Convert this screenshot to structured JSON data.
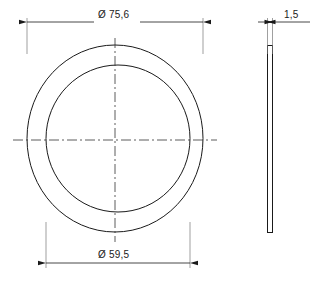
{
  "drawing": {
    "type": "engineering-drawing",
    "subject": "flat ring / shim washer",
    "units": "mm",
    "line_color": "#1a1a1a",
    "centerline_color": "#333333",
    "background_color": "#ffffff",
    "views": {
      "front": {
        "name": "front-view",
        "shape": "annulus",
        "outer_diameter_label": "Ø 75,6",
        "outer_diameter_value": 75.6,
        "inner_diameter_label": "Ø 59,5",
        "inner_diameter_value": 59.5
      },
      "side": {
        "name": "side-view",
        "shape": "thin-rectangle",
        "thickness_label": "1,5",
        "thickness_value": 1.5
      }
    },
    "dimensions": [
      {
        "id": "outer-diameter",
        "label": "Ø 75,6",
        "value": 75.6,
        "symbol": "Ø",
        "placement": "top",
        "arrows": "outward"
      },
      {
        "id": "inner-diameter",
        "label": "Ø 59,5",
        "value": 59.5,
        "symbol": "Ø",
        "placement": "bottom",
        "arrows": "outward"
      },
      {
        "id": "thickness",
        "label": "1,5",
        "value": 1.5,
        "symbol": "",
        "placement": "top-right",
        "arrows": "outward"
      }
    ]
  }
}
